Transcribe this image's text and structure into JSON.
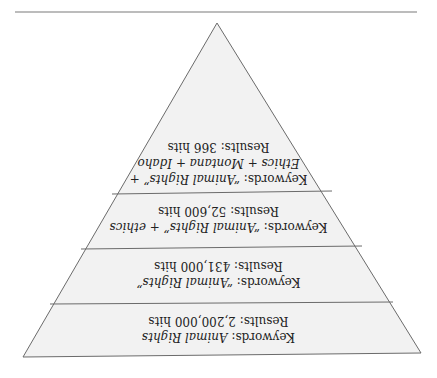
{
  "diagram": {
    "type": "inverted-pyramid",
    "orientation": "rotated-180",
    "colors": {
      "fill": "#f2f2f2",
      "stroke": "#6b6b6b",
      "text": "#222222",
      "rule": "#7a7a7a"
    },
    "bands": [
      {
        "keywords_label": "Keywords:",
        "keywords_value": "Animal Rights",
        "keywords_value_2": "",
        "results_label": "Results:",
        "results_value": "2,200,000 hits"
      },
      {
        "keywords_label": "Keywords:",
        "keywords_value": "“Animal Rights”",
        "keywords_value_2": "",
        "results_label": "Results:",
        "results_value": "431,000 hits"
      },
      {
        "keywords_label": "Keywords:",
        "keywords_value": "“Animal Rights” + ethics",
        "keywords_value_2": "",
        "results_label": "Results:",
        "results_value": "52,600 hits"
      },
      {
        "keywords_label": "Keywords:",
        "keywords_value": "“Animal Rights” +",
        "keywords_value_2": "Ethics + Montana + Idaho",
        "results_label": "Results:",
        "results_value": "366 hits"
      }
    ]
  }
}
